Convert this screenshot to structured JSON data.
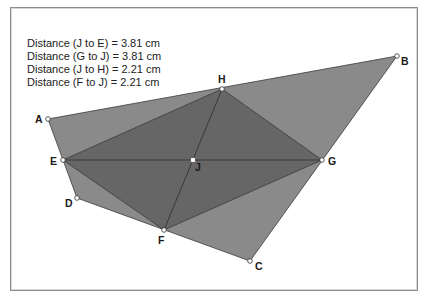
{
  "measurements": [
    {
      "label": "Distance (J to E)",
      "equals": "=",
      "value": "3.81 cm"
    },
    {
      "label": "Distance (G to J)",
      "equals": "=",
      "value": "3.81 cm"
    },
    {
      "label": "Distance (J to H)",
      "equals": "=",
      "value": "2.21 cm"
    },
    {
      "label": "Distance (F to J)",
      "equals": "=",
      "value": "2.21 cm"
    }
  ],
  "colors": {
    "outer_quad_fill": "#8a8a8a",
    "inner_parallelogram_fill": "#666666",
    "edge_stroke": "#3a3a3a",
    "point_fill": "#ffffff",
    "point_stroke": "#333333",
    "background": "#ffffff"
  },
  "points": {
    "A": {
      "label": "A",
      "x": 48,
      "y": 119
    },
    "B": {
      "label": "B",
      "x": 397,
      "y": 56
    },
    "C": {
      "label": "C",
      "x": 250,
      "y": 261
    },
    "D": {
      "label": "D",
      "x": 77,
      "y": 198
    },
    "E": {
      "label": "E",
      "x": 63,
      "y": 160
    },
    "F": {
      "label": "F",
      "x": 164,
      "y": 230
    },
    "G": {
      "label": "G",
      "x": 322,
      "y": 160
    },
    "H": {
      "label": "H",
      "x": 222,
      "y": 89
    },
    "J": {
      "label": "J",
      "x": 193,
      "y": 160
    }
  }
}
